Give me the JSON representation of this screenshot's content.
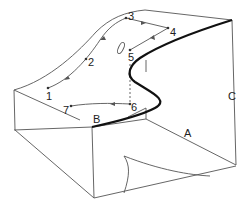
{
  "diagram": {
    "type": "cusp-catastrophe-surface",
    "path_points": [
      {
        "label": "1",
        "x": 48,
        "y": 88
      },
      {
        "label": "2",
        "x": 86,
        "y": 60
      },
      {
        "label": "3",
        "x": 126,
        "y": 20
      },
      {
        "label": "4",
        "x": 168,
        "y": 31
      },
      {
        "label": "5",
        "x": 155,
        "y": 56
      },
      {
        "label": "6",
        "x": 156,
        "y": 103
      },
      {
        "label": "7",
        "x": 71,
        "y": 106
      }
    ],
    "axis_labels": [
      {
        "label": "A",
        "x": 185,
        "y": 136
      },
      {
        "label": "B",
        "x": 93,
        "y": 122
      },
      {
        "label": "C",
        "x": 230,
        "y": 99
      }
    ],
    "colors": {
      "line": "#555555",
      "fold_edge": "#111111",
      "background": "#ffffff"
    }
  }
}
